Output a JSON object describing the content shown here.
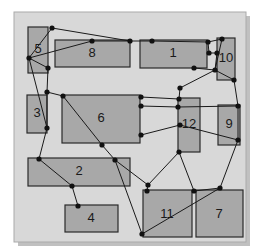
{
  "figure": {
    "canvas": {
      "x": 14,
      "y": 12,
      "width": 232,
      "height": 230,
      "background_color": "#d8d8d8",
      "border_color": "#aaaaaa",
      "shadow_color": "#c0c0c0"
    },
    "style": {
      "rect_fill": "#a8a8a8",
      "rect_stroke": "#2a2a2a",
      "edge_color": "#1a1a1a",
      "node_color": "#111111",
      "node_radius": 2.6,
      "edge_width": 1.0,
      "rect_stroke_width": 1.2
    }
  },
  "regions": [
    {
      "id": "region-5",
      "label": "5",
      "x": 28,
      "y": 27,
      "width": 20,
      "height": 46,
      "label_x": 38,
      "label_y": 50
    },
    {
      "id": "region-8",
      "label": "8",
      "x": 55,
      "y": 40,
      "width": 75,
      "height": 27,
      "label_x": 92,
      "label_y": 54
    },
    {
      "id": "region-1",
      "label": "1",
      "x": 140,
      "y": 40,
      "width": 67,
      "height": 28,
      "label_x": 173,
      "label_y": 54
    },
    {
      "id": "region-10",
      "label": "10",
      "x": 217,
      "y": 38,
      "width": 18,
      "height": 42,
      "label_x": 226,
      "label_y": 59
    },
    {
      "id": "region-3",
      "label": "3",
      "x": 27,
      "y": 95,
      "width": 20,
      "height": 38,
      "label_x": 37,
      "label_y": 114
    },
    {
      "id": "region-6",
      "label": "6",
      "x": 62,
      "y": 95,
      "width": 78,
      "height": 48,
      "label_x": 101,
      "label_y": 119
    },
    {
      "id": "region-12",
      "label": "12",
      "x": 178,
      "y": 98,
      "width": 22,
      "height": 54,
      "label_x": 189,
      "label_y": 125
    },
    {
      "id": "region-9",
      "label": "9",
      "x": 218,
      "y": 105,
      "width": 22,
      "height": 40,
      "label_x": 229,
      "label_y": 125
    },
    {
      "id": "region-2",
      "label": "2",
      "x": 28,
      "y": 158,
      "width": 102,
      "height": 28,
      "label_x": 79,
      "label_y": 172
    },
    {
      "id": "region-4",
      "label": "4",
      "x": 65,
      "y": 205,
      "width": 53,
      "height": 27,
      "label_x": 91,
      "label_y": 219
    },
    {
      "id": "region-11",
      "label": "11",
      "x": 143,
      "y": 190,
      "width": 49,
      "height": 47,
      "label_x": 167,
      "label_y": 215
    },
    {
      "id": "region-7",
      "label": "7",
      "x": 196,
      "y": 190,
      "width": 47,
      "height": 47,
      "label_x": 219,
      "label_y": 215
    }
  ],
  "nodes": [
    {
      "id": "n1",
      "x": 52,
      "y": 28
    },
    {
      "id": "n2",
      "x": 92,
      "y": 41
    },
    {
      "id": "n3",
      "x": 130,
      "y": 41
    },
    {
      "id": "n4",
      "x": 152,
      "y": 41
    },
    {
      "id": "n5",
      "x": 208,
      "y": 42
    },
    {
      "id": "n6",
      "x": 222,
      "y": 39
    },
    {
      "id": "n7",
      "x": 29,
      "y": 58
    },
    {
      "id": "n8",
      "x": 209,
      "y": 53
    },
    {
      "id": "n9",
      "x": 217,
      "y": 53
    },
    {
      "id": "n10",
      "x": 48,
      "y": 68
    },
    {
      "id": "n11",
      "x": 194,
      "y": 68
    },
    {
      "id": "n12",
      "x": 215,
      "y": 70
    },
    {
      "id": "n13",
      "x": 47,
      "y": 92
    },
    {
      "id": "n14",
      "x": 234,
      "y": 80
    },
    {
      "id": "n15",
      "x": 180,
      "y": 88
    },
    {
      "id": "n16",
      "x": 63,
      "y": 96
    },
    {
      "id": "n17",
      "x": 141,
      "y": 97
    },
    {
      "id": "n18",
      "x": 179,
      "y": 99
    },
    {
      "id": "n19",
      "x": 141,
      "y": 106
    },
    {
      "id": "n20",
      "x": 178,
      "y": 107
    },
    {
      "id": "n21",
      "x": 47,
      "y": 128
    },
    {
      "id": "n22",
      "x": 238,
      "y": 106
    },
    {
      "id": "n23",
      "x": 180,
      "y": 125
    },
    {
      "id": "n24",
      "x": 141,
      "y": 135
    },
    {
      "id": "n25",
      "x": 238,
      "y": 140
    },
    {
      "id": "n26",
      "x": 102,
      "y": 145
    },
    {
      "id": "n27",
      "x": 179,
      "y": 152
    },
    {
      "id": "n28",
      "x": 39,
      "y": 159
    },
    {
      "id": "n29",
      "x": 115,
      "y": 160
    },
    {
      "id": "n30",
      "x": 72,
      "y": 186
    },
    {
      "id": "n31",
      "x": 148,
      "y": 185
    },
    {
      "id": "n32",
      "x": 78,
      "y": 206
    },
    {
      "id": "n33",
      "x": 147,
      "y": 191
    },
    {
      "id": "n34",
      "x": 194,
      "y": 191
    },
    {
      "id": "n35",
      "x": 220,
      "y": 188
    },
    {
      "id": "n36",
      "x": 142,
      "y": 234
    }
  ],
  "edges": [
    {
      "from": "n1",
      "to": "n3"
    },
    {
      "from": "n1",
      "to": "n7"
    },
    {
      "from": "n2",
      "to": "n3"
    },
    {
      "from": "n2",
      "to": "n7"
    },
    {
      "from": "n3",
      "to": "n4"
    },
    {
      "from": "n4",
      "to": "n5"
    },
    {
      "from": "n5",
      "to": "n6"
    },
    {
      "from": "n5",
      "to": "n8"
    },
    {
      "from": "n8",
      "to": "n9"
    },
    {
      "from": "n9",
      "to": "n12"
    },
    {
      "from": "n6",
      "to": "n12"
    },
    {
      "from": "n11",
      "to": "n12"
    },
    {
      "from": "n12",
      "to": "n14"
    },
    {
      "from": "n12",
      "to": "n15"
    },
    {
      "from": "n14",
      "to": "n22"
    },
    {
      "from": "n7",
      "to": "n10"
    },
    {
      "from": "n10",
      "to": "n13"
    },
    {
      "from": "n7",
      "to": "n21"
    },
    {
      "from": "n13",
      "to": "n21"
    },
    {
      "from": "n13",
      "to": "n16"
    },
    {
      "from": "n21",
      "to": "n28"
    },
    {
      "from": "n16",
      "to": "n26"
    },
    {
      "from": "n26",
      "to": "n29"
    },
    {
      "from": "n29",
      "to": "n31"
    },
    {
      "from": "n15",
      "to": "n18"
    },
    {
      "from": "n17",
      "to": "n18"
    },
    {
      "from": "n19",
      "to": "n20"
    },
    {
      "from": "n20",
      "to": "n22"
    },
    {
      "from": "n23",
      "to": "n24"
    },
    {
      "from": "n23",
      "to": "n25"
    },
    {
      "from": "n22",
      "to": "n25"
    },
    {
      "from": "n25",
      "to": "n35"
    },
    {
      "from": "n27",
      "to": "n31"
    },
    {
      "from": "n27",
      "to": "n34"
    },
    {
      "from": "n28",
      "to": "n30"
    },
    {
      "from": "n30",
      "to": "n32"
    },
    {
      "from": "n29",
      "to": "n36"
    },
    {
      "from": "n31",
      "to": "n33"
    },
    {
      "from": "n34",
      "to": "n35"
    },
    {
      "from": "n35",
      "to": "n36"
    }
  ]
}
